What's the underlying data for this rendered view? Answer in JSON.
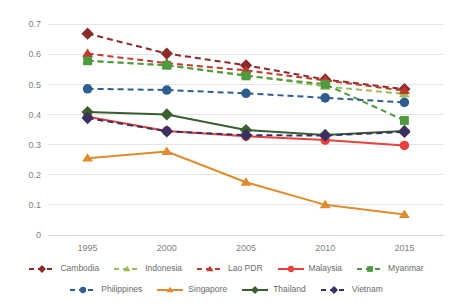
{
  "chart_data": {
    "type": "line",
    "title": "",
    "xlabel": "",
    "ylabel": "",
    "x": [
      1995,
      2000,
      2005,
      2010,
      2015
    ],
    "categories": [
      "1995",
      "2000",
      "2005",
      "2010",
      "2015"
    ],
    "ylim": [
      0,
      0.7
    ],
    "yticks": [
      "0",
      "0.1",
      "0.2",
      "0.3",
      "0.4",
      "0.5",
      "0.6",
      "0.7"
    ],
    "ytick_values": [
      0,
      0.1,
      0.2,
      0.3,
      0.4,
      0.5,
      0.6,
      0.7
    ],
    "grid": "horizontal",
    "legend_position": "bottom",
    "series": [
      {
        "name": "Cambodia",
        "color": "#8C2A2A",
        "dash": "dashed",
        "marker": "diamond",
        "values": [
          0.668,
          0.602,
          0.563,
          0.516,
          0.484
        ]
      },
      {
        "name": "Indonesia",
        "color": "#9BBB59",
        "dash": "dashed",
        "marker": "triangle",
        "values": [
          0.578,
          0.563,
          0.53,
          0.493,
          0.468
        ]
      },
      {
        "name": "Lao PDR",
        "color": "#C0392B",
        "dash": "dashed",
        "marker": "triangle",
        "values": [
          0.602,
          0.57,
          0.546,
          0.513,
          0.479
        ]
      },
      {
        "name": "Malaysia",
        "color": "#E8403A",
        "dash": "solid",
        "marker": "circle",
        "values": [
          0.392,
          0.345,
          0.328,
          0.315,
          0.297
        ]
      },
      {
        "name": "Myanmar",
        "color": "#4E9A3F",
        "dash": "dashed",
        "marker": "square",
        "values": [
          0.578,
          0.563,
          0.528,
          0.5,
          0.38
        ]
      },
      {
        "name": "Philippines",
        "color": "#2E5E8E",
        "dash": "dashed",
        "marker": "circle",
        "values": [
          0.485,
          0.481,
          0.47,
          0.455,
          0.44
        ]
      },
      {
        "name": "Singapore",
        "color": "#E08B2D",
        "dash": "solid",
        "marker": "triangle",
        "values": [
          0.255,
          0.277,
          0.175,
          0.1,
          0.068
        ]
      },
      {
        "name": "Thailand",
        "color": "#3A5F2E",
        "dash": "solid",
        "marker": "diamond",
        "values": [
          0.408,
          0.4,
          0.348,
          0.332,
          0.345
        ]
      },
      {
        "name": "Vietnam",
        "color": "#3B2F63",
        "dash": "dashed",
        "marker": "diamond",
        "values": [
          0.388,
          0.344,
          0.331,
          0.33,
          0.342
        ]
      }
    ]
  },
  "legend": {
    "row1": [
      "Cambodia",
      "Indonesia",
      "Lao PDR",
      "Malaysia",
      "Myanmar"
    ],
    "row2": [
      "Philippines",
      "Singapore",
      "Thailand",
      "Vietnam"
    ]
  }
}
